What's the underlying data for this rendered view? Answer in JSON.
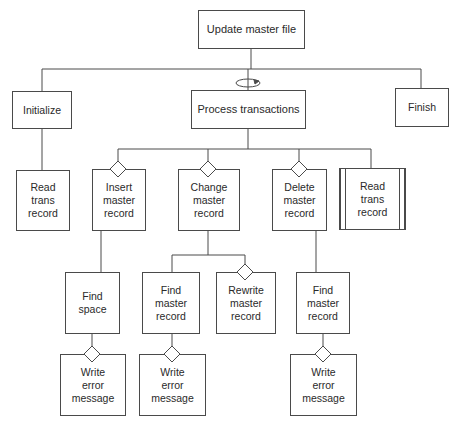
{
  "diagram": {
    "type": "structure-chart",
    "nodes": {
      "root": {
        "label": "Update master file"
      },
      "initialize": {
        "label": "Initialize"
      },
      "process": {
        "label": "Process transactions",
        "iteration": true
      },
      "finish": {
        "label": "Finish"
      },
      "read_trans_1": {
        "label": "Read\ntrans\nrecord"
      },
      "insert": {
        "label": "Insert\nmaster\nrecord",
        "selection": true
      },
      "change": {
        "label": "Change\nmaster\nrecord",
        "selection": true
      },
      "delete": {
        "label": "Delete\nmaster\nrecord",
        "selection": true
      },
      "read_trans_2": {
        "label": "Read\ntrans\nrecord",
        "predefined": true
      },
      "find_space": {
        "label": "Find\nspace"
      },
      "find_master_change": {
        "label": "Find\nmaster\nrecord"
      },
      "rewrite_master": {
        "label": "Rewrite\nmaster\nrecord",
        "selection": true
      },
      "find_master_delete": {
        "label": "Find\nmaster\nrecord"
      },
      "write_error_1": {
        "label": "Write\nerror\nmessage",
        "selection": true
      },
      "write_error_2": {
        "label": "Write\nerror\nmessage",
        "selection": true
      },
      "write_error_3": {
        "label": "Write\nerror\nmessage",
        "selection": true
      }
    },
    "edges": [
      [
        "root",
        "initialize"
      ],
      [
        "root",
        "process"
      ],
      [
        "root",
        "finish"
      ],
      [
        "initialize",
        "read_trans_1"
      ],
      [
        "process",
        "insert"
      ],
      [
        "process",
        "change"
      ],
      [
        "process",
        "delete"
      ],
      [
        "process",
        "read_trans_2"
      ],
      [
        "insert",
        "find_space"
      ],
      [
        "change",
        "find_master_change"
      ],
      [
        "change",
        "rewrite_master"
      ],
      [
        "delete",
        "find_master_delete"
      ],
      [
        "find_space",
        "write_error_1"
      ],
      [
        "find_master_change",
        "write_error_2"
      ],
      [
        "find_master_delete",
        "write_error_3"
      ]
    ],
    "colors": {
      "line": "#4a4a4a",
      "background": "#ffffff",
      "text": "#2a2a2a"
    }
  }
}
